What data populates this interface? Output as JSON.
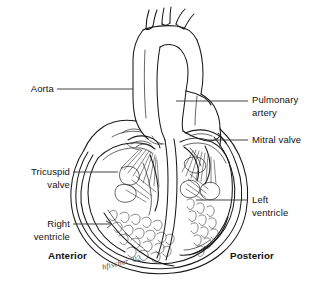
{
  "diagram": {
    "view": "coronal cross-section",
    "style": "black-and-white line art",
    "line_color": "#1a1a1a",
    "background_color": "#ffffff",
    "text_color": "#121212"
  },
  "labels": {
    "aorta": "Aorta",
    "tricuspid_valve": "Tricuspid\nvalve",
    "right_ventricle": "Right\nventricle",
    "pulmonary_artery": "Pulmonary\nartery",
    "mitral_valve": "Mitral valve",
    "left_ventricle": "Left\nventricle",
    "anterior": "Anterior",
    "posterior": "Posterior"
  },
  "signature": {
    "text": "hfischer '02"
  },
  "structures": [
    "aortic arch",
    "brachiocephalic branch vessels",
    "ascending aorta",
    "pulmonary artery",
    "mitral valve",
    "tricuspid valve",
    "right ventricle",
    "left ventricle",
    "interventricular septum",
    "papillary muscles",
    "chordae tendineae",
    "trabeculae carneae",
    "myocardium wall",
    "cardiac apex"
  ],
  "leader_lines": [
    {
      "name": "aorta-leader",
      "x1": 57,
      "y1": 89,
      "x2": 133,
      "y2": 89,
      "arrow": false
    },
    {
      "name": "tricuspid-leader",
      "x1": 73,
      "y1": 172,
      "x2": 118,
      "y2": 172,
      "arrow": false
    },
    {
      "name": "right-ventricle-leader",
      "x1": 73,
      "y1": 224,
      "x2": 112,
      "y2": 224,
      "arrow": true
    },
    {
      "name": "pulmonary-artery-leader",
      "x1": 176,
      "y1": 101,
      "x2": 248,
      "y2": 101,
      "arrow": false
    },
    {
      "name": "mitral-valve-leader",
      "x1": 203,
      "y1": 140,
      "x2": 248,
      "y2": 140,
      "arrow": false
    },
    {
      "name": "left-ventricle-leader",
      "x1": 196,
      "y1": 200,
      "x2": 248,
      "y2": 200,
      "arrow": false
    }
  ]
}
